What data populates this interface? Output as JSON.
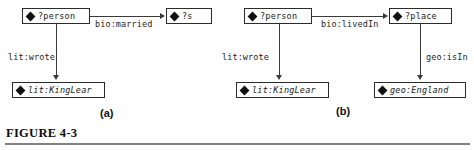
{
  "figure": {
    "caption": "FIGURE 4-3",
    "subfigures": [
      {
        "id": "a",
        "caption": "(a)"
      },
      {
        "id": "b",
        "caption": "(b)"
      }
    ]
  },
  "diagram_a": {
    "nodes": [
      {
        "id": "a-person",
        "label": "?person",
        "kind": "variable"
      },
      {
        "id": "a-s",
        "label": "?s",
        "kind": "variable"
      },
      {
        "id": "a-kinglear",
        "label": "lit:KingLear",
        "kind": "literal"
      }
    ],
    "edges": [
      {
        "id": "a-married",
        "label": "bio:married",
        "from": "?person",
        "to": "?s",
        "direction": "right"
      },
      {
        "id": "a-wrote",
        "label": "lit:wrote",
        "from": "?person",
        "to": "lit:KingLear",
        "direction": "down"
      }
    ]
  },
  "diagram_b": {
    "nodes": [
      {
        "id": "b-person",
        "label": "?person",
        "kind": "variable"
      },
      {
        "id": "b-place",
        "label": "?place",
        "kind": "variable"
      },
      {
        "id": "b-kinglear",
        "label": "lit:KingLear",
        "kind": "literal"
      },
      {
        "id": "b-england",
        "label": "geo:England",
        "kind": "literal"
      }
    ],
    "edges": [
      {
        "id": "b-livedin",
        "label": "bio:livedIn",
        "from": "?person",
        "to": "?place",
        "direction": "right"
      },
      {
        "id": "b-wrote",
        "label": "lit:wrote",
        "from": "?person",
        "to": "lit:KingLear",
        "direction": "down"
      },
      {
        "id": "b-isin",
        "label": "geo:isIn",
        "from": "?place",
        "to": "geo:England",
        "direction": "down"
      }
    ]
  },
  "colors": {
    "node_border": "#2b2b2b",
    "edge": "#3a3a3a",
    "rule": "#808080",
    "text": "#1a1a1a"
  }
}
